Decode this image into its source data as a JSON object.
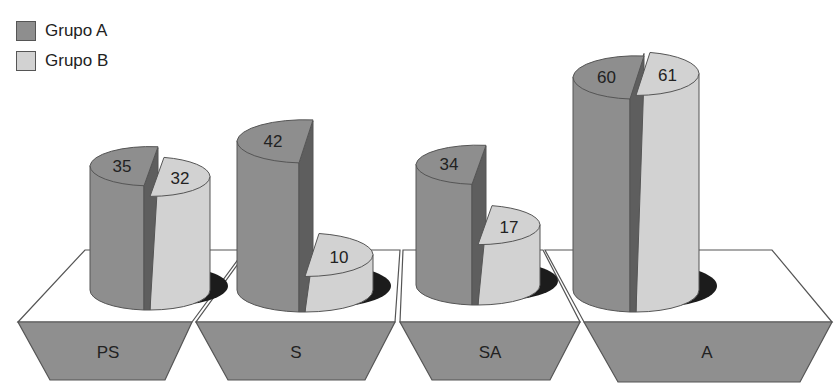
{
  "chart_data": {
    "type": "bar",
    "subtype": "3d-cylinder-pie-split",
    "title": "",
    "xlabel": "",
    "ylabel": "",
    "categories": [
      "PS",
      "S",
      "SA",
      "A"
    ],
    "series": [
      {
        "name": "Grupo A",
        "values": [
          35,
          42,
          34,
          60
        ],
        "color": "#8e8e8e"
      },
      {
        "name": "Grupo B",
        "values": [
          32,
          10,
          17,
          61
        ],
        "color": "#d2d2d2"
      }
    ],
    "data_labels": true,
    "legend_position": "top-left",
    "grid": false
  },
  "legend": {
    "items": [
      {
        "label": "Grupo A",
        "color": "#8e8e8e"
      },
      {
        "label": "Grupo B",
        "color": "#d2d2d2"
      }
    ]
  },
  "colors": {
    "series_a": "#8e8e8e",
    "series_a_dark": "#5e5e5e",
    "series_b": "#d2d2d2",
    "base_front": "#8f8f8f",
    "base_top": "#ffffff",
    "shadow": "#1c1c1c",
    "outline": "#555555"
  }
}
